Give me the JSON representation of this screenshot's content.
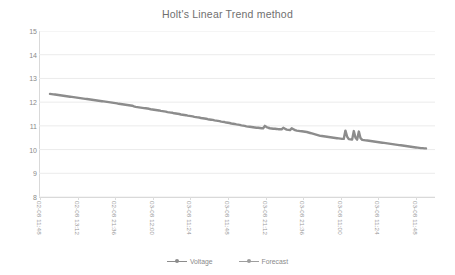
{
  "chart_data": {
    "type": "line",
    "title": "Holt's Linear Trend method",
    "xlabel": "",
    "ylabel": "",
    "ylim": [
      8,
      15
    ],
    "y_ticks": [
      8,
      9,
      10,
      11,
      12,
      13,
      14,
      15
    ],
    "grid": true,
    "grid_axis": "y",
    "legend_position": "bottom",
    "x_tick_labels": [
      "02-08 11:48",
      "02-08 13:12",
      "02-08 21:36",
      "03-08 12:00",
      "03-08 11:24",
      "03-08 11:48",
      "03-08 21:12",
      "03-08 21:36",
      "03-08 11:00",
      "03-08 11:24",
      "03-08 11:48"
    ],
    "series": [
      {
        "name": "Voltage",
        "color": "#8c8c8c",
        "marker": "circle",
        "values": [
          12.35,
          12.34,
          12.33,
          12.32,
          12.31,
          12.3,
          12.29,
          12.28,
          12.27,
          12.26,
          12.25,
          12.24,
          12.23,
          12.22,
          12.21,
          12.2,
          12.19,
          12.18,
          12.17,
          12.16,
          12.15,
          12.14,
          12.13,
          12.12,
          12.11,
          12.1,
          12.09,
          12.08,
          12.07,
          12.06,
          12.05,
          12.04,
          12.03,
          12.02,
          12.01,
          12.0,
          11.99,
          11.98,
          11.97,
          11.96,
          11.95,
          11.93,
          11.92,
          11.91,
          11.9,
          11.89,
          11.88,
          11.87,
          11.86,
          11.85,
          11.82,
          11.8,
          11.79,
          11.78,
          11.77,
          11.76,
          11.75,
          11.74,
          11.73,
          11.72,
          11.7,
          11.69,
          11.68,
          11.67,
          11.66,
          11.65,
          11.63,
          11.62,
          11.61,
          11.6,
          11.58,
          11.57,
          11.56,
          11.55,
          11.53,
          11.52,
          11.51,
          11.5,
          11.48,
          11.47,
          11.46,
          11.45,
          11.43,
          11.42,
          11.41,
          11.4,
          11.38,
          11.37,
          11.36,
          11.35,
          11.33,
          11.32,
          11.31,
          11.3,
          11.28,
          11.27,
          11.26,
          11.25,
          11.23,
          11.22,
          11.21,
          11.2,
          11.18,
          11.17,
          11.16,
          11.14,
          11.13,
          11.12,
          11.1,
          11.09,
          11.08,
          11.06,
          11.05,
          11.04,
          11.02,
          11.01,
          11.0,
          10.98,
          10.97,
          10.96,
          10.95,
          10.94,
          10.93,
          10.92,
          10.92,
          10.91,
          10.9,
          10.9,
          11.0,
          10.95,
          10.92,
          10.9,
          10.89,
          10.88,
          10.88,
          10.87,
          10.86,
          10.86,
          10.85,
          10.92,
          10.88,
          10.84,
          10.83,
          10.82,
          10.9,
          10.86,
          10.82,
          10.8,
          10.79,
          10.78,
          10.77,
          10.76,
          10.75,
          10.74,
          10.72,
          10.7,
          10.68,
          10.66,
          10.64,
          10.62,
          10.6,
          10.58,
          10.57,
          10.56,
          10.55,
          10.54,
          10.53,
          10.52,
          10.51,
          10.5,
          10.49,
          10.48,
          10.47,
          10.46,
          10.45,
          10.45,
          10.8,
          10.55,
          10.44,
          10.43,
          10.42,
          10.78,
          10.5,
          10.42,
          10.76,
          10.48,
          10.41,
          10.4,
          10.39,
          10.38,
          10.37,
          10.36,
          10.35,
          10.34,
          10.33,
          10.32,
          10.31,
          10.3,
          10.29,
          10.28,
          10.27,
          10.26,
          10.25,
          10.24,
          10.23,
          10.22,
          10.21,
          10.2,
          10.19,
          10.18,
          10.17,
          10.16,
          10.15,
          10.14,
          10.13,
          10.12,
          10.11,
          10.1,
          10.09,
          10.08,
          10.07,
          10.06,
          10.06,
          10.05,
          10.05
        ]
      },
      {
        "name": "Forecast",
        "color": "#9e9e9e",
        "marker": "circle",
        "values": []
      }
    ]
  },
  "legend": {
    "items": [
      {
        "label": "Voltage",
        "color": "#8c8c8c"
      },
      {
        "label": "Forecast",
        "color": "#9e9e9e"
      }
    ]
  }
}
